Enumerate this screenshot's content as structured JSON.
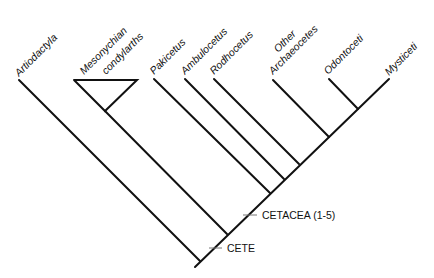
{
  "diagram": {
    "type": "cladogram",
    "taxa": [
      {
        "id": "artiodactyla",
        "label": "Artiodactyla",
        "lines": [
          "Artiodactyla"
        ]
      },
      {
        "id": "mesonychian",
        "label": "Mesonychian condylarths",
        "lines": [
          "Mesonychian",
          "condylarths"
        ]
      },
      {
        "id": "pakicetus",
        "label": "Pakicetus",
        "lines": [
          "Pakicetus"
        ]
      },
      {
        "id": "ambulocetus",
        "label": "Ambulocetus",
        "lines": [
          "Ambulocetus"
        ]
      },
      {
        "id": "rodhocetus",
        "label": "Rodhocetus",
        "lines": [
          "Rodhocetus"
        ]
      },
      {
        "id": "other-archaeocetes",
        "label": "Other Archaeocetes",
        "lines": [
          "Other",
          "Archaeocetes"
        ]
      },
      {
        "id": "odontoceti",
        "label": "Odontoceti",
        "lines": [
          "Odontoceti"
        ]
      },
      {
        "id": "mysticeti",
        "label": "Mysticeti",
        "lines": [
          "Mysticeti"
        ]
      }
    ],
    "clades": [
      {
        "id": "cetacea",
        "label": "CETACEA (1-5)"
      },
      {
        "id": "cete",
        "label": "CETE"
      }
    ],
    "colors": {
      "line": "#111111",
      "text": "#111111",
      "tick": "#777777",
      "background": "#ffffff"
    }
  }
}
